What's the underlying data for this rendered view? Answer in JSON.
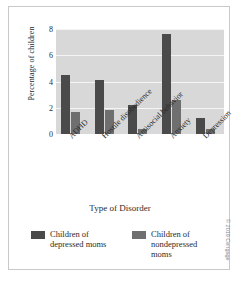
{
  "chart_data": {
    "type": "bar",
    "title": "",
    "xlabel": "Type of Disorder",
    "ylabel": "Percentage of children",
    "categories": [
      "ADHD",
      "Hostile disobedience",
      "Antisocial behavior",
      "Anxiety",
      "Depression"
    ],
    "series": [
      {
        "name": "Children of depressed moms",
        "color": "#4a4a4a",
        "values": [
          4.5,
          4.1,
          2.2,
          7.6,
          1.2
        ]
      },
      {
        "name": "Children of nondepressed moms",
        "color": "#6f6f6f",
        "values": [
          1.7,
          1.8,
          0.4,
          2.6,
          0.4
        ]
      }
    ],
    "ylim": [
      0,
      8
    ],
    "yticks": [
      0,
      2,
      4,
      6,
      8
    ],
    "ytick_labels": [
      "0",
      "2",
      "4",
      "6",
      "8"
    ],
    "grid": true,
    "legend_position": "bottom",
    "plot_background": "#d8d8d8",
    "gridline_color": "#f4f4f4"
  },
  "legend": {
    "items": [
      {
        "label_line1": "Children of",
        "label_line2": "depressed moms",
        "label_line3": ""
      },
      {
        "label_line1": "Children of",
        "label_line2": "nondepressed",
        "label_line3": "moms"
      }
    ]
  },
  "credit": "© 2019 Cengage"
}
